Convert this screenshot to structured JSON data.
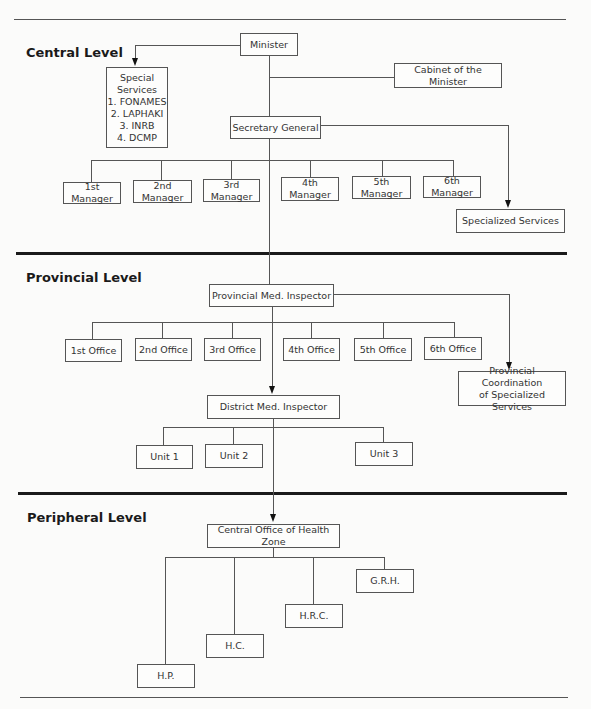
{
  "levels": {
    "central": "Central Level",
    "provincial": "Provincial Level",
    "peripheral": "Peripheral Level"
  },
  "central": {
    "minister": "Minister",
    "cabinet": "Cabinet of the Minister",
    "special_services": {
      "title_line1": "Special",
      "title_line2": "Services",
      "items": [
        "1. FONAMES",
        "2. LAPHAKI",
        "3. INRB",
        "4. DCMP"
      ]
    },
    "secretary_general": "Secretary General",
    "managers": [
      "1st Manager",
      "2nd Manager",
      "3rd Manager",
      "4th Manager",
      "5th Manager",
      "6th Manager"
    ],
    "specialized_services": "Specialized Services"
  },
  "provincial": {
    "inspector": "Provincial Med. Inspector",
    "offices": [
      "1st Office",
      "2nd Office",
      "3rd Office",
      "4th Office",
      "5th Office",
      "6th Office"
    ],
    "coordination_line1": "Provincial Coordination",
    "coordination_line2": "of Specialized Services",
    "district_inspector": "District Med. Inspector",
    "units": [
      "Unit 1",
      "Unit 2",
      "Unit 3"
    ]
  },
  "peripheral": {
    "central_office": "Central Office of Health Zone",
    "facilities": [
      "G.R.H.",
      "H.R.C.",
      "H.C.",
      "H.P."
    ]
  }
}
